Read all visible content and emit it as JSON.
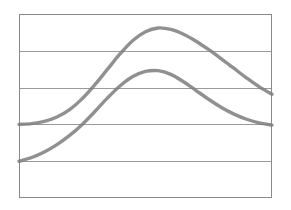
{
  "chart_data": {
    "type": "line",
    "title": "",
    "subtitle": "",
    "xlabel": "",
    "ylabel": "",
    "grid": true,
    "grid_orientation": "horizontal",
    "legend": "none",
    "xlim": [
      0,
      100
    ],
    "ylim": [
      0,
      5
    ],
    "x_tick_labels": [],
    "y_tick_labels": [],
    "gridline_values": [
      0,
      1,
      2,
      3,
      4,
      5
    ],
    "x": [
      0,
      5,
      10,
      15,
      20,
      25,
      30,
      35,
      40,
      45,
      50,
      55,
      60,
      65,
      70,
      75,
      80,
      85,
      90,
      95,
      100
    ],
    "series": [
      {
        "name": "curve-upper",
        "color": "#7d7d7d",
        "values": [
          2.0,
          2.02,
          2.08,
          2.2,
          2.4,
          2.7,
          3.08,
          3.5,
          3.92,
          4.28,
          4.52,
          4.62,
          4.58,
          4.45,
          4.26,
          4.03,
          3.78,
          3.52,
          3.26,
          3.02,
          2.82
        ]
      },
      {
        "name": "curve-lower",
        "color": "#7d7d7d",
        "values": [
          1.0,
          1.1,
          1.25,
          1.45,
          1.7,
          2.0,
          2.35,
          2.72,
          3.05,
          3.3,
          3.44,
          3.46,
          3.36,
          3.16,
          2.92,
          2.68,
          2.46,
          2.28,
          2.14,
          2.04,
          1.98
        ]
      }
    ],
    "annotations": []
  },
  "figure": {
    "background_color": "#ffffff",
    "frame_color": "#8a8a8a",
    "gridline_color": "#8f8f8f",
    "line_color": "#7d7d7d",
    "frame": {
      "left": 19,
      "top": 14,
      "right": 272,
      "bottom": 198
    }
  }
}
